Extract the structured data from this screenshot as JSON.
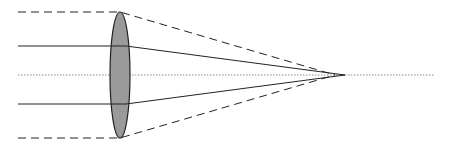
{
  "diagram": {
    "title": "",
    "type": "spherical-aberration-lens",
    "colors": {
      "background": "#ffffff",
      "lens_fill": "#9a9a9a",
      "lens_stroke": "#222222",
      "ray": "#222222",
      "axis": "#888888"
    },
    "lens": {
      "cx": 120,
      "cy": 75,
      "rx": 10,
      "ry": 63
    },
    "optical_axis": {
      "x1": 18,
      "y1": 75,
      "x2": 435,
      "y2": 75
    },
    "marginal_rays": [
      {
        "x_start": 18,
        "y": 12,
        "x_lens": 120,
        "focus_x": 335,
        "focus_y": 75
      },
      {
        "x_start": 18,
        "y": 138,
        "x_lens": 120,
        "focus_x": 335,
        "focus_y": 75
      }
    ],
    "paraxial_rays": [
      {
        "x_start": 18,
        "y": 46,
        "x_lens": 126,
        "focus_x": 345,
        "focus_y": 75
      },
      {
        "x_start": 18,
        "y": 104,
        "x_lens": 126,
        "focus_x": 345,
        "focus_y": 75
      }
    ]
  }
}
